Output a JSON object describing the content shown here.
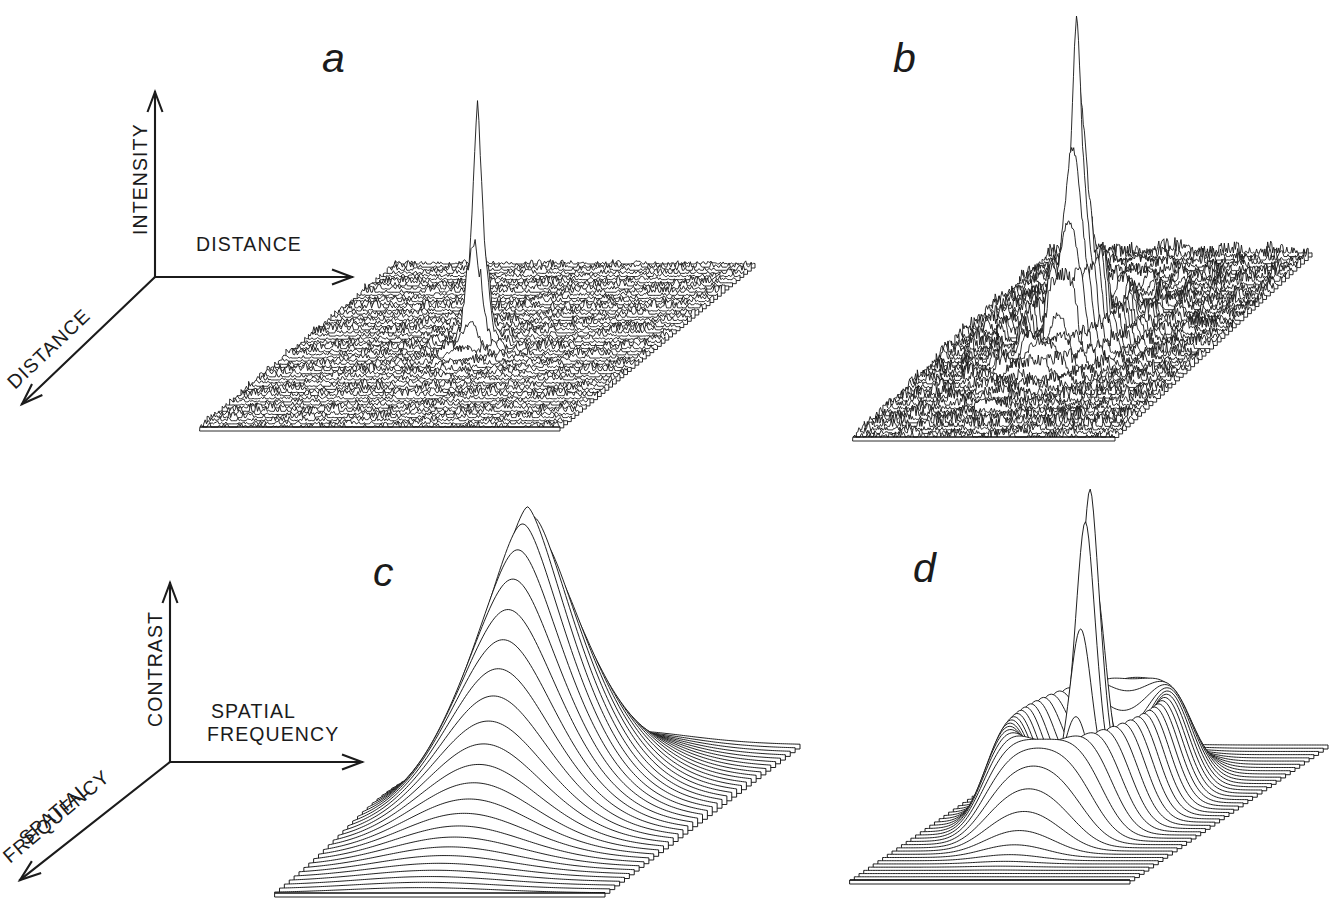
{
  "figure": {
    "background_color": "#ffffff",
    "ink_color": "#1b1b1b",
    "width": 1334,
    "height": 902
  },
  "axes_top": {
    "name": "spatial-domain-axes",
    "vertical_label": "INTENSITY",
    "horizontal_label": "DISTANCE",
    "depth_label": "DISTANCE",
    "origin": [
      155,
      277
    ],
    "vertical_tip": [
      155,
      92
    ],
    "horizontal_tip": [
      352,
      277
    ],
    "depth_tip": [
      22,
      404
    ]
  },
  "axes_bottom": {
    "name": "frequency-domain-axes",
    "vertical_label": "CONTRAST",
    "horizontal_label_line1": "SPATIAL",
    "horizontal_label_line2": "FREQUENCY",
    "depth_label_line1": "SPATIAL",
    "depth_label_line2": "FREQUENCY",
    "origin": [
      170,
      762
    ],
    "vertical_tip": [
      170,
      583
    ],
    "horizontal_tip": [
      362,
      762
    ],
    "depth_tip": [
      20,
      880
    ]
  },
  "panels": [
    {
      "id": "a",
      "letter": "a",
      "letter_pos": [
        322,
        72
      ],
      "domain": "spatial",
      "description": "point spread function of an optically good eye: single narrow spike on a noisy baseline plane"
    },
    {
      "id": "b",
      "letter": "b",
      "letter_pos": [
        893,
        72
      ],
      "domain": "spatial",
      "description": "point spread function of a defocused eye: tall central spike with secondary peaks and concentric ripples on a noisy plane"
    },
    {
      "id": "c",
      "letter": "c",
      "letter_pos": [
        373,
        586
      ],
      "domain": "frequency",
      "description": "modulation transfer function of a good eye: smooth broad single low-pass peak"
    },
    {
      "id": "d",
      "letter": "d",
      "letter_pos": [
        913,
        582
      ],
      "domain": "frequency",
      "description": "modulation transfer function of a defocused eye: narrow central peak surrounded by an annular side lobe"
    }
  ],
  "chart_data": [
    {
      "id": "a",
      "type": "surface",
      "title": "",
      "xlabel": "DISTANCE",
      "ylabel": "DISTANCE",
      "zlabel": "INTENSITY",
      "grid": false,
      "legend": "none",
      "plane_corners": [
        [
          395,
          264
        ],
        [
          755,
          264
        ],
        [
          560,
          427
        ],
        [
          200,
          427
        ]
      ],
      "n_traces": 52,
      "surface": "spike",
      "peak_center": [
        0.5,
        0.5
      ],
      "peak_height": 1.0,
      "peak_width": 0.022,
      "ring_amplitude": 0.1,
      "ring_period": 0.055,
      "noise_amplitude": 0.055,
      "z_scale": 240,
      "shading": "dense-noisy-baseline"
    },
    {
      "id": "b",
      "type": "surface",
      "title": "",
      "xlabel": "DISTANCE",
      "ylabel": "DISTANCE",
      "zlabel": "INTENSITY",
      "grid": false,
      "legend": "none",
      "plane_corners": [
        [
          1050,
          253
        ],
        [
          1312,
          253
        ],
        [
          1115,
          437
        ],
        [
          853,
          437
        ]
      ],
      "n_traces": 52,
      "surface": "multi-spike",
      "peak_center": [
        0.42,
        0.42
      ],
      "peak_height": 1.0,
      "peak_width": 0.05,
      "ring_amplitude": 0.27,
      "ring_period": 0.085,
      "noise_amplitude": 0.07,
      "z_scale": 250,
      "shading": "dense-noisy-baseline"
    },
    {
      "id": "c",
      "type": "surface",
      "title": "",
      "xlabel": "SPATIAL FREQUENCY",
      "ylabel": "SPATIAL FREQUENCY",
      "zlabel": "CONTRAST",
      "grid": false,
      "legend": "none",
      "plane_corners": [
        [
          470,
          745
        ],
        [
          800,
          745
        ],
        [
          605,
          893
        ],
        [
          275,
          893
        ]
      ],
      "n_traces": 40,
      "surface": "broad-peak",
      "peak_center": [
        0.44,
        0.45
      ],
      "peak_height": 1.0,
      "peak_width": 0.21,
      "ring_amplitude": 0.0,
      "ring_period": 0.0,
      "noise_amplitude": 0.0,
      "z_scale": 305,
      "shading": "clean-hidden-line"
    },
    {
      "id": "d",
      "type": "surface",
      "title": "",
      "xlabel": "SPATIAL FREQUENCY",
      "ylabel": "SPATIAL FREQUENCY",
      "zlabel": "CONTRAST",
      "grid": false,
      "legend": "none",
      "plane_corners": [
        [
          1048,
          745
        ],
        [
          1328,
          745
        ],
        [
          1130,
          880
        ],
        [
          850,
          880
        ]
      ],
      "n_traces": 42,
      "surface": "peak-plus-ring",
      "peak_center": [
        0.47,
        0.46
      ],
      "peak_height": 1.0,
      "peak_width": 0.055,
      "ring_amplitude": 0.3,
      "ring_radius": 0.23,
      "ring_width": 0.1,
      "noise_amplitude": 0.0,
      "z_scale": 330,
      "shading": "clean-hidden-line"
    }
  ]
}
